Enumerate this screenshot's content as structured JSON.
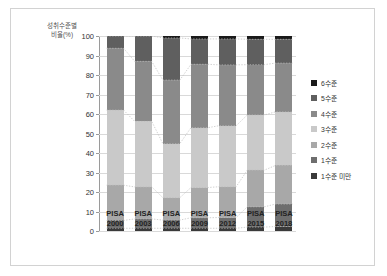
{
  "axis_title": "성취수준별\n비율(%)",
  "axis_title_line1": "성취수준별",
  "axis_title_line2": "비율(%)",
  "legend": {
    "items": [
      {
        "label": "6수준",
        "color": "#1a1a1a"
      },
      {
        "label": "5수준",
        "color": "#5f5f5f"
      },
      {
        "label": "4수준",
        "color": "#8a8a8a"
      },
      {
        "label": "3수준",
        "color": "#c9c9c9"
      },
      {
        "label": "2수준",
        "color": "#a8a8a8"
      },
      {
        "label": "1수준",
        "color": "#6e6e6e"
      },
      {
        "label": "1수준 미만",
        "color": "#3a3a3a"
      }
    ]
  },
  "chart_data": {
    "type": "bar",
    "subtype": "stacked-column-100",
    "title": "",
    "xlabel": "",
    "ylabel": "성취수준별 비율(%)",
    "ylim": [
      0,
      100
    ],
    "yticks": [
      0,
      10,
      20,
      30,
      40,
      50,
      60,
      70,
      80,
      90,
      100
    ],
    "ytick_labels": [
      "0",
      "10",
      "20",
      "30",
      "40",
      "50",
      "60",
      "70",
      "80",
      "90",
      "100"
    ],
    "grid": true,
    "legend_position": "right",
    "categories": [
      "PISA 2000",
      "PISA 2003",
      "PISA 2006",
      "PISA 2009",
      "PISA 2012",
      "PISA 2015",
      "PISA 2018"
    ],
    "category_lines": [
      [
        "PISA",
        "2000"
      ],
      [
        "PISA",
        "2003"
      ],
      [
        "PISA",
        "2006"
      ],
      [
        "PISA",
        "2009"
      ],
      [
        "PISA",
        "2012"
      ],
      [
        "PISA",
        "2015"
      ],
      [
        "PISA",
        "2018"
      ]
    ],
    "stack_order_bottom_to_top": [
      "1수준 미만",
      "1수준",
      "2수준",
      "3수준",
      "4수준",
      "5수준",
      "6수준"
    ],
    "series": [
      {
        "name": "1수준 미만",
        "color": "#3a3a3a",
        "values": [
          1.4,
          1.4,
          1.4,
          1.4,
          1.4,
          2.0,
          2.3
        ]
      },
      {
        "name": "1수준",
        "color": "#6e6e6e",
        "values": [
          4.0,
          4.8,
          4.2,
          5.4,
          5.5,
          10.4,
          11.5
        ]
      },
      {
        "name": "2수준",
        "color": "#a8a8a8",
        "values": [
          18.1,
          16.4,
          11.5,
          15.5,
          15.8,
          18.8,
          19.8
        ]
      },
      {
        "name": "3수준",
        "color": "#c9c9c9",
        "values": [
          38.5,
          33.6,
          27.7,
          30.7,
          31.3,
          28.3,
          27.5
        ]
      },
      {
        "name": "4수준",
        "color": "#8a8a8a",
        "values": [
          31.7,
          30.8,
          32.6,
          32.5,
          31.2,
          25.8,
          25.0
        ]
      },
      {
        "name": "5수준",
        "color": "#5f5f5f",
        "values": [
          6.3,
          13.0,
          21.6,
          13.0,
          13.3,
          13.0,
          12.2
        ]
      },
      {
        "name": "6수준",
        "color": "#1a1a1a",
        "values": [
          0.0,
          0.0,
          1.0,
          1.5,
          1.5,
          1.7,
          1.7
        ]
      }
    ],
    "cumulative_tops_bottom_to_top": {
      "1수준 미만": [
        1.4,
        1.4,
        1.4,
        1.4,
        1.4,
        2.0,
        2.3
      ],
      "1수준": [
        5.4,
        6.2,
        5.6,
        6.8,
        6.9,
        12.4,
        13.8
      ],
      "2수준": [
        23.5,
        22.6,
        17.1,
        22.3,
        22.7,
        31.2,
        33.6
      ],
      "3수준": [
        62.0,
        56.2,
        44.8,
        53.0,
        54.0,
        59.5,
        61.1
      ],
      "4수준": [
        93.7,
        87.0,
        77.4,
        85.5,
        85.2,
        85.3,
        86.1
      ],
      "5수준": [
        100.0,
        100.0,
        99.0,
        98.5,
        98.5,
        98.3,
        98.3
      ],
      "6수준": [
        100.0,
        100.0,
        100.0,
        100.0,
        100.0,
        100.0,
        100.0
      ]
    },
    "connector_lines": true
  },
  "colors": {
    "grid": "#d9d9d9",
    "axis": "#9a9a9a",
    "frame": "#d2d2d2",
    "background": "#ffffff",
    "connector": "#bdbdbd"
  }
}
